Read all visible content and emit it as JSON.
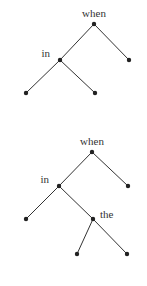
{
  "trees": [
    {
      "name": "tree-1",
      "labels": {
        "root": "when",
        "left": "in"
      }
    },
    {
      "name": "tree-2",
      "labels": {
        "root": "when",
        "left": "in",
        "leftright": "the"
      }
    }
  ],
  "colors": {
    "line": "#333333",
    "node": "#222222",
    "text": "#333333",
    "background": "#ffffff"
  }
}
